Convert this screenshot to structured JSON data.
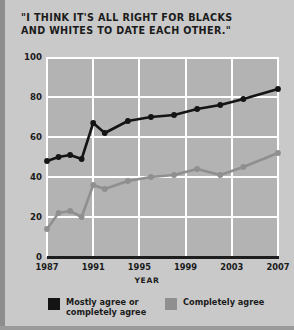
{
  "title": "\"I THINK IT'S ALL RIGHT FOR BLACKS\nAND WHITES TO DATE EACH OTHER.\"",
  "colors": {
    "background": "#c9c9c9",
    "plot_background": "#b3b3b3",
    "gridline": "#ffffff",
    "axis": "#1d1d1d",
    "text": "#1b1b1b",
    "series_dark": "#141414",
    "series_light": "#8f8f8f"
  },
  "legend": {
    "position": "bottom",
    "items": [
      {
        "label": "Mostly agree or\ncompletely agree",
        "color": "#141414"
      },
      {
        "label": "Completely agree",
        "color": "#8f8f8f"
      }
    ]
  },
  "chart_data": {
    "type": "line",
    "title": "\"I THINK IT'S ALL RIGHT FOR BLACKS AND WHITES TO DATE EACH OTHER.\"",
    "xlabel": "YEAR",
    "ylabel": "PERCENT",
    "xlim": [
      1987,
      2007
    ],
    "ylim": [
      0,
      100
    ],
    "ytick_labels": [
      "0",
      "20",
      "40",
      "60",
      "80",
      "100"
    ],
    "yticks": [
      0,
      20,
      40,
      60,
      80,
      100
    ],
    "xtick_labels": [
      "1987",
      "1991",
      "1995",
      "1999",
      "2003",
      "2007"
    ],
    "xticks": [
      1987,
      1991,
      1995,
      1999,
      2003,
      2007
    ],
    "grid": true,
    "series": [
      {
        "name": "Mostly agree or completely agree",
        "color": "#141414",
        "x": [
          1987,
          1988,
          1989,
          1990,
          1991,
          1992,
          1994,
          1996,
          1998,
          2000,
          2002,
          2004,
          2007
        ],
        "values": [
          48,
          50,
          51,
          49,
          67,
          62,
          68,
          70,
          71,
          74,
          76,
          79,
          84
        ]
      },
      {
        "name": "Completely agree",
        "color": "#8f8f8f",
        "x": [
          1987,
          1988,
          1989,
          1990,
          1991,
          1992,
          1994,
          1996,
          1998,
          2000,
          2002,
          2004,
          2007
        ],
        "values": [
          14,
          22,
          23,
          20,
          36,
          34,
          38,
          40,
          41,
          44,
          41,
          45,
          52
        ]
      }
    ]
  }
}
